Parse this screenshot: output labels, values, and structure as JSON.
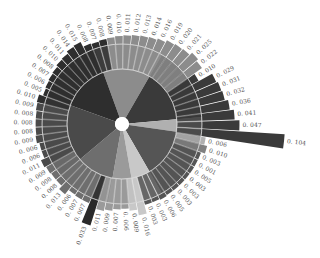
{
  "chart_data": {
    "type": "radial-bar",
    "title": "",
    "center": {
      "x": 122,
      "y": 124
    },
    "inner_ring_radius": 55,
    "outer_ring_radius": 80,
    "bar_base_radius": 80,
    "value_scale_px_per_unit": 1450,
    "sector_groups": [
      {
        "start_deg": -110,
        "end_deg": -60,
        "color": "#8c8c8c"
      },
      {
        "start_deg": -60,
        "end_deg": -5,
        "color": "#3a3a3a"
      },
      {
        "start_deg": -5,
        "end_deg": 8,
        "color": "#b0b0b0"
      },
      {
        "start_deg": 8,
        "end_deg": 60,
        "color": "#555555"
      },
      {
        "start_deg": 60,
        "end_deg": 80,
        "color": "#c8c8c8"
      },
      {
        "start_deg": 80,
        "end_deg": 100,
        "color": "#9a9a9a"
      },
      {
        "start_deg": 100,
        "end_deg": 140,
        "color": "#6e6e6e"
      },
      {
        "start_deg": 140,
        "end_deg": 200,
        "color": "#4a4a4a"
      },
      {
        "start_deg": 200,
        "end_deg": 250,
        "color": "#2e2e2e"
      }
    ],
    "bars": [
      {
        "value": 0.009,
        "color": "#8c8c8c"
      },
      {
        "value": 0.01,
        "color": "#8c8c8c"
      },
      {
        "value": 0.011,
        "color": "#8c8c8c"
      },
      {
        "value": 0.012,
        "color": "#8c8c8c"
      },
      {
        "value": 0.013,
        "color": "#8c8c8c"
      },
      {
        "value": 0.014,
        "color": "#8c8c8c"
      },
      {
        "value": 0.016,
        "color": "#8c8c8c"
      },
      {
        "value": 0.019,
        "color": "#8c8c8c"
      },
      {
        "value": 0.02,
        "color": "#8c8c8c"
      },
      {
        "value": 0.021,
        "color": "#8c8c8c"
      },
      {
        "value": 0.025,
        "color": "#8c8c8c"
      },
      {
        "value": 0.022,
        "color": "#8c8c8c"
      },
      {
        "value": 0.01,
        "color": "#3a3a3a"
      },
      {
        "value": 0.029,
        "color": "#3a3a3a"
      },
      {
        "value": 0.031,
        "color": "#3a3a3a"
      },
      {
        "value": 0.032,
        "color": "#3a3a3a"
      },
      {
        "value": 0.036,
        "color": "#3a3a3a"
      },
      {
        "value": 0.041,
        "color": "#3a3a3a"
      },
      {
        "value": 0.047,
        "color": "#3a3a3a"
      },
      {
        "value": 0.104,
        "color": "#3a3a3a"
      },
      {
        "value": 0.006,
        "color": "#b0b0b0"
      },
      {
        "value": 0.01,
        "color": "#808080"
      },
      {
        "value": 0.003,
        "color": "#555555"
      },
      {
        "value": 0.001,
        "color": "#555555"
      },
      {
        "value": 0.005,
        "color": "#555555"
      },
      {
        "value": 0.003,
        "color": "#555555"
      },
      {
        "value": 0.003,
        "color": "#555555"
      },
      {
        "value": 0.003,
        "color": "#555555"
      },
      {
        "value": 0.005,
        "color": "#555555"
      },
      {
        "value": 0.006,
        "color": "#555555"
      },
      {
        "value": 0.003,
        "color": "#555555"
      },
      {
        "value": 0.003,
        "color": "#555555"
      },
      {
        "value": 0.016,
        "color": "#c8c8c8"
      },
      {
        "value": 0.009,
        "color": "#c8c8c8"
      },
      {
        "value": 0.006,
        "color": "#9a9a9a"
      },
      {
        "value": 0.007,
        "color": "#9a9a9a"
      },
      {
        "value": 0.009,
        "color": "#9a9a9a"
      },
      {
        "value": 0.011,
        "color": "#9a9a9a"
      },
      {
        "value": 0.033,
        "color": "#2a2a2a"
      },
      {
        "value": 0.007,
        "color": "#6e6e6e"
      },
      {
        "value": 0.007,
        "color": "#6e6e6e"
      },
      {
        "value": 0.006,
        "color": "#6e6e6e"
      },
      {
        "value": 0.013,
        "color": "#6e6e6e"
      },
      {
        "value": 0.008,
        "color": "#6e6e6e"
      },
      {
        "value": 0.008,
        "color": "#6e6e6e"
      },
      {
        "value": 0.009,
        "color": "#6e6e6e"
      },
      {
        "value": 0.011,
        "color": "#4a4a4a"
      },
      {
        "value": 0.006,
        "color": "#4a4a4a"
      },
      {
        "value": 0.006,
        "color": "#4a4a4a"
      },
      {
        "value": 0.009,
        "color": "#4a4a4a"
      },
      {
        "value": 0.008,
        "color": "#4a4a4a"
      },
      {
        "value": 0.008,
        "color": "#4a4a4a"
      },
      {
        "value": 0.008,
        "color": "#4a4a4a"
      },
      {
        "value": 0.009,
        "color": "#4a4a4a"
      },
      {
        "value": 0.01,
        "color": "#2e2e2e"
      },
      {
        "value": 0.005,
        "color": "#2e2e2e"
      },
      {
        "value": 0.006,
        "color": "#2e2e2e"
      },
      {
        "value": 0.007,
        "color": "#2e2e2e"
      },
      {
        "value": 0.008,
        "color": "#2e2e2e"
      },
      {
        "value": 0.01,
        "color": "#2e2e2e"
      },
      {
        "value": 0.011,
        "color": "#2e2e2e"
      },
      {
        "value": 0.014,
        "color": "#2e2e2e"
      },
      {
        "value": 0.015,
        "color": "#2e2e2e"
      },
      {
        "value": 0.008,
        "color": "#2e2e2e"
      },
      {
        "value": 0.007,
        "color": "#2e2e2e"
      },
      {
        "value": 0.008,
        "color": "#2e2e2e"
      }
    ],
    "start_angle_deg": -100,
    "legend": [],
    "xlabel": "",
    "ylabel": ""
  }
}
